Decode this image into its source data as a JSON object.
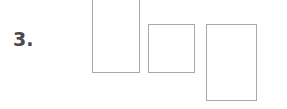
{
  "figure": {
    "background_color": "#ffffff",
    "width": 287,
    "height": 109,
    "item_number": "3.",
    "item_number_color": "#4a4a4a",
    "shape_border_color": "#a9a9a9",
    "shape_fill_color": "#ffffff",
    "shapes": [
      {
        "name": "rectangle-1",
        "label": "",
        "x": 92,
        "y": -8,
        "width": 48,
        "height": 81,
        "note": "tall rectangle, top edge clipped by canvas"
      },
      {
        "name": "rectangle-2",
        "label": "",
        "x": 148,
        "y": 24,
        "width": 47,
        "height": 49,
        "note": "square rectangle, shortest"
      },
      {
        "name": "rectangle-3",
        "label": "",
        "x": 206,
        "y": 24,
        "width": 51,
        "height": 77,
        "note": "tallest rectangle, extends lowest"
      }
    ]
  }
}
